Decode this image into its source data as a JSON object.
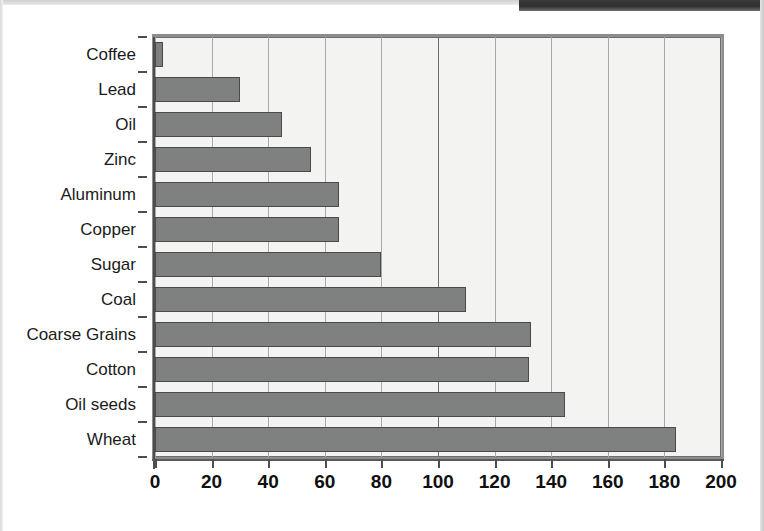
{
  "chart_data": {
    "type": "bar",
    "orientation": "horizontal",
    "title": "",
    "subtitle": "",
    "xlabel": "",
    "ylabel": "",
    "categories": [
      "Coffee",
      "Lead",
      "Oil",
      "Zinc",
      "Aluminum",
      "Copper",
      "Sugar",
      "Coal",
      "Coarse Grains",
      "Cotton",
      "Oil seeds",
      "Wheat"
    ],
    "values": [
      3,
      30,
      45,
      55,
      65,
      65,
      80,
      110,
      133,
      132,
      145,
      184
    ],
    "xlim": [
      0,
      200
    ],
    "xticks": [
      0,
      20,
      40,
      60,
      80,
      100,
      120,
      140,
      160,
      180,
      200
    ],
    "xtick_labels": [
      "0",
      "20",
      "40",
      "60",
      "80",
      "100",
      "120",
      "140",
      "160",
      "180",
      "200"
    ],
    "grid": true,
    "grid_axis": "x",
    "legend": null,
    "legend_position": "none",
    "annotations": []
  },
  "style": {
    "bar_fill": "#7f8080",
    "bar_stroke": "#4a4a4a",
    "plot_background": "#f3f3f1",
    "gridline_color": "#a8a8a8",
    "gridline_major_color": "#6a6a6a",
    "frame_color": "#8d8d8d",
    "axis_color": "#4d4d4d",
    "label_color": "#1b1b1b",
    "page_background": "#ffffff"
  }
}
